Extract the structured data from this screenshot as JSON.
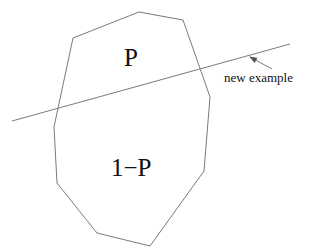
{
  "diagram": {
    "region": {
      "shape": "polygon",
      "vertices": [
        [
          139,
          12
        ],
        [
          183,
          20
        ],
        [
          210,
          97
        ],
        [
          204,
          171
        ],
        [
          150,
          246
        ],
        [
          97,
          233
        ],
        [
          57,
          183
        ],
        [
          54,
          127
        ],
        [
          73,
          38
        ]
      ],
      "stroke": "#7a7a7a"
    },
    "separator_line": {
      "from": [
        12,
        121
      ],
      "to": [
        290,
        44
      ],
      "stroke": "#7a7a7a"
    },
    "arrow": {
      "from": [
        272,
        69
      ],
      "to": [
        250,
        57
      ],
      "stroke": "#7a7a7a"
    },
    "labels": {
      "upper_region": "P",
      "lower_region": "1−P",
      "line_label": "new example"
    }
  }
}
